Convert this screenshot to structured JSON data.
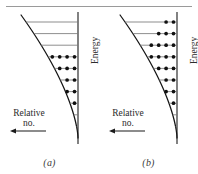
{
  "figure": {
    "title_rule": true,
    "axis_labels": {
      "energy": "Energy",
      "relative_line1": "Relative",
      "relative_line2": "no."
    },
    "panels": [
      {
        "id": "a",
        "caption": "(a)",
        "description": "Low-temperature Boltzmann population: only the lowest vibrational levels are occupied; the three highest levels drawn are empty.",
        "n_levels": 11,
        "empty_levels_from_top": 3,
        "dot_counts_top_to_bottom": [
          0,
          0,
          0,
          7,
          7,
          6,
          5,
          4,
          3,
          2,
          1
        ]
      },
      {
        "id": "b",
        "caption": "(b)",
        "description": "Higher-temperature Boltzmann population: every level drawn carries population.",
        "n_levels": 11,
        "empty_levels_from_top": 0,
        "dot_counts_top_to_bottom": [
          2,
          3,
          4,
          5,
          5,
          5,
          5,
          4,
          3,
          2,
          1
        ]
      }
    ],
    "geometry": {
      "axis_x": 78,
      "top_y": 22,
      "bottom_y": 138,
      "level_spacing": 11.6,
      "curve_opens": "left-upward parabola (potential wall)",
      "arrow_direction": "left"
    },
    "colors": {
      "ink": "#1a1a1a",
      "level_line": "#7a7a7a",
      "curve": "#141414",
      "dot": "#101010",
      "rule": "#9a9a9a",
      "background": "#ffffff"
    }
  }
}
